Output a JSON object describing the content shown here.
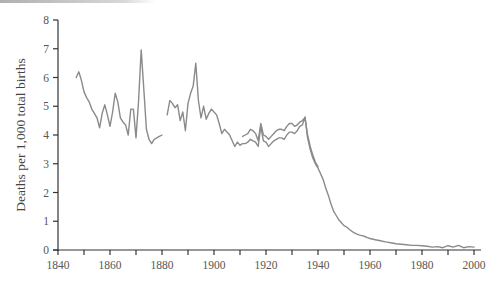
{
  "chart_data": {
    "type": "line",
    "title": "",
    "xlabel": "",
    "ylabel": "Deaths per 1,000 total births",
    "xlim": [
      1840,
      2000
    ],
    "ylim": [
      0,
      8
    ],
    "xticks": [
      1840,
      1860,
      1880,
      1900,
      1920,
      1940,
      1960,
      1980,
      2000
    ],
    "xminor_ticks": [
      1850,
      1870,
      1890,
      1910,
      1930,
      1950,
      1970,
      1990
    ],
    "yticks": [
      0,
      1,
      2,
      3,
      4,
      5,
      6,
      7,
      8
    ],
    "grid": false,
    "legend": null,
    "line_color": "#8a8a8a",
    "series": [
      {
        "name": "series-1",
        "segments": [
          {
            "x": [
              1847,
              1848,
              1849,
              1850,
              1851,
              1852,
              1853,
              1854,
              1855,
              1856,
              1857,
              1858,
              1859,
              1860,
              1861,
              1862,
              1863,
              1864,
              1865,
              1866,
              1867,
              1868,
              1869,
              1870,
              1871,
              1872,
              1873,
              1874,
              1875,
              1876,
              1877,
              1878,
              1879,
              1880
            ],
            "y": [
              6.0,
              6.2,
              5.9,
              5.5,
              5.3,
              5.15,
              4.9,
              4.75,
              4.6,
              4.25,
              4.75,
              5.05,
              4.7,
              4.3,
              4.8,
              5.45,
              5.15,
              4.6,
              4.45,
              4.35,
              4.0,
              4.9,
              4.9,
              3.9,
              5.2,
              6.96,
              5.6,
              4.2,
              3.85,
              3.7,
              3.85,
              3.9,
              3.95,
              4.0
            ]
          },
          {
            "x": [
              1882,
              1883,
              1884,
              1885,
              1886,
              1887,
              1888,
              1889,
              1890,
              1891,
              1892,
              1893,
              1894,
              1895,
              1896,
              1897,
              1898,
              1899,
              1900,
              1901,
              1902,
              1903,
              1904,
              1905,
              1906,
              1907,
              1908,
              1909,
              1910
            ],
            "y": [
              4.7,
              5.2,
              5.1,
              4.95,
              5.05,
              4.5,
              4.8,
              4.15,
              5.1,
              5.45,
              5.7,
              6.5,
              5.2,
              4.6,
              5.0,
              4.55,
              4.75,
              4.9,
              4.8,
              4.7,
              4.4,
              4.05,
              4.2,
              4.1,
              4.0,
              3.8,
              3.6,
              3.75,
              3.65
            ]
          },
          {
            "x": [
              1910,
              1911,
              1912,
              1913,
              1914,
              1915,
              1916,
              1917,
              1918,
              1919,
              1920,
              1921,
              1922,
              1923,
              1924,
              1925,
              1926,
              1927,
              1928,
              1929,
              1930,
              1931,
              1932,
              1933,
              1934,
              1935,
              1936,
              1937,
              1938,
              1939,
              1940,
              1941,
              1942,
              1943,
              1944,
              1945,
              1946,
              1947,
              1948,
              1949,
              1950,
              1951,
              1952,
              1953,
              1954,
              1955,
              1956,
              1957,
              1958,
              1959,
              1960,
              1962,
              1964,
              1966,
              1968,
              1970,
              1972,
              1974,
              1976,
              1978,
              1980,
              1982,
              1984,
              1986,
              1988,
              1990,
              1992,
              1994,
              1996,
              1998,
              2000
            ],
            "y": [
              3.65,
              3.7,
              3.7,
              3.75,
              3.85,
              3.8,
              3.75,
              3.6,
              4.3,
              3.8,
              3.75,
              3.6,
              3.7,
              3.8,
              3.85,
              3.9,
              3.9,
              3.85,
              4.0,
              4.1,
              4.1,
              4.05,
              4.15,
              4.3,
              4.35,
              4.63,
              3.9,
              3.5,
              3.2,
              3.0,
              2.85,
              2.65,
              2.45,
              2.15,
              1.9,
              1.6,
              1.35,
              1.2,
              1.05,
              0.95,
              0.85,
              0.8,
              0.72,
              0.65,
              0.6,
              0.55,
              0.52,
              0.5,
              0.47,
              0.43,
              0.4,
              0.36,
              0.32,
              0.28,
              0.25,
              0.22,
              0.2,
              0.18,
              0.16,
              0.16,
              0.15,
              0.13,
              0.1,
              0.12,
              0.08,
              0.15,
              0.1,
              0.16,
              0.08,
              0.12,
              0.1
            ]
          }
        ]
      },
      {
        "name": "series-2",
        "segments": [
          {
            "x": [
              1911,
              1912,
              1913,
              1914,
              1915,
              1916,
              1917,
              1918,
              1919,
              1920,
              1921,
              1922,
              1923,
              1924,
              1925,
              1926,
              1927,
              1928,
              1929,
              1930,
              1931,
              1932,
              1933,
              1934,
              1935,
              1936,
              1937,
              1938,
              1939,
              1940
            ],
            "y": [
              3.95,
              4.0,
              4.05,
              4.2,
              4.15,
              4.05,
              3.8,
              4.4,
              4.0,
              3.95,
              3.85,
              3.95,
              4.05,
              4.15,
              4.2,
              4.2,
              4.15,
              4.3,
              4.4,
              4.4,
              4.3,
              4.35,
              4.45,
              4.5,
              4.6,
              4.0,
              3.6,
              3.3,
              3.05,
              2.9
            ]
          }
        ]
      }
    ]
  },
  "axes": {
    "y_title": "Deaths per 1,000 total births",
    "x_tick_labels": [
      "1840",
      "1860",
      "1880",
      "1900",
      "1920",
      "1940",
      "1960",
      "1980",
      "2000"
    ],
    "y_tick_labels": [
      "0",
      "1",
      "2",
      "3",
      "4",
      "5",
      "6",
      "7",
      "8"
    ]
  }
}
